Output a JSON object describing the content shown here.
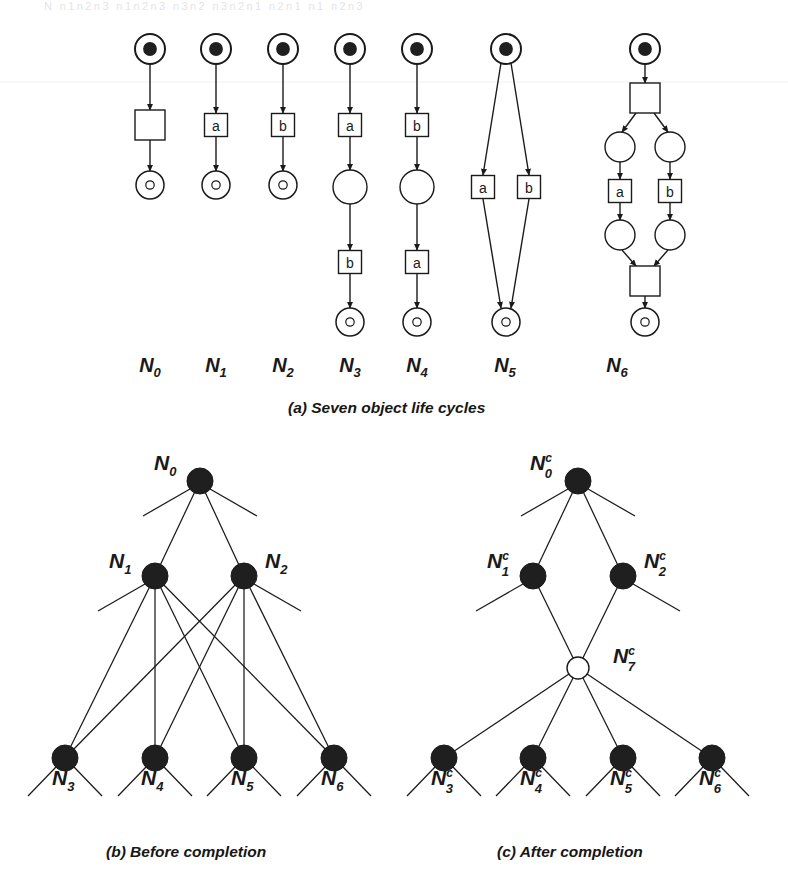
{
  "page": {
    "width": 788,
    "height": 892,
    "background": "#ffffff",
    "ink": "#1a1a1a",
    "node_fill_black": "#1f1f1f",
    "node_fill_white": "#ffffff",
    "header_faint_text": "N n1n2n3   n1n2n3 n3n2   n3n2n1   n2n1   n1   n2n3"
  },
  "figure": {
    "panels": [
      {
        "id": "a",
        "caption": "(a) Seven object life cycles",
        "caption_x": 288,
        "caption_y": 399
      },
      {
        "id": "b",
        "caption": "(b) Before completion",
        "caption_x": 106,
        "caption_y": 843
      },
      {
        "id": "c",
        "caption": "(c) After completion",
        "caption_x": 497,
        "caption_y": 843
      }
    ]
  },
  "panel_a": {
    "title": "Seven object life cycles",
    "net_labels": [
      {
        "text": "N",
        "sub": "0",
        "x": 150,
        "y": 372
      },
      {
        "text": "N",
        "sub": "1",
        "x": 216,
        "y": 372
      },
      {
        "text": "N",
        "sub": "2",
        "x": 283,
        "y": 372
      },
      {
        "text": "N",
        "sub": "3",
        "x": 350,
        "y": 372
      },
      {
        "text": "N",
        "sub": "4",
        "x": 417,
        "y": 372
      },
      {
        "text": "N",
        "sub": "5",
        "x": 505,
        "y": 372
      },
      {
        "text": "N",
        "sub": "6",
        "x": 617,
        "y": 372
      }
    ],
    "nets": [
      {
        "name": "N0",
        "places": [
          {
            "kind": "start",
            "cx": 150,
            "cy": 49,
            "r": 15
          },
          {
            "kind": "final",
            "cx": 150,
            "cy": 185,
            "r": 14
          }
        ],
        "transitions": [
          {
            "label": "",
            "cx": 150,
            "cy": 125,
            "w": 30,
            "h": 30
          }
        ],
        "arcs": [
          {
            "x1": 150,
            "y1": 64,
            "x2": 150,
            "y2": 110
          },
          {
            "x1": 150,
            "y1": 140,
            "x2": 150,
            "y2": 171
          }
        ]
      },
      {
        "name": "N1",
        "places": [
          {
            "kind": "start",
            "cx": 216,
            "cy": 49,
            "r": 15
          },
          {
            "kind": "final",
            "cx": 216,
            "cy": 185,
            "r": 14
          }
        ],
        "transitions": [
          {
            "label": "a",
            "cx": 216,
            "cy": 125,
            "w": 23,
            "h": 23
          }
        ],
        "arcs": [
          {
            "x1": 216,
            "y1": 64,
            "x2": 216,
            "y2": 113
          },
          {
            "x1": 216,
            "y1": 137,
            "x2": 216,
            "y2": 171
          }
        ]
      },
      {
        "name": "N2",
        "places": [
          {
            "kind": "start",
            "cx": 283,
            "cy": 49,
            "r": 15
          },
          {
            "kind": "final",
            "cx": 283,
            "cy": 185,
            "r": 14
          }
        ],
        "transitions": [
          {
            "label": "b",
            "cx": 283,
            "cy": 125,
            "w": 23,
            "h": 23
          }
        ],
        "arcs": [
          {
            "x1": 283,
            "y1": 64,
            "x2": 283,
            "y2": 113
          },
          {
            "x1": 283,
            "y1": 137,
            "x2": 283,
            "y2": 171
          }
        ]
      },
      {
        "name": "N3",
        "places": [
          {
            "kind": "start",
            "cx": 350,
            "cy": 49,
            "r": 15
          },
          {
            "kind": "plain",
            "cx": 350,
            "cy": 187,
            "r": 17
          },
          {
            "kind": "final",
            "cx": 350,
            "cy": 322,
            "r": 14
          }
        ],
        "transitions": [
          {
            "label": "a",
            "cx": 350,
            "cy": 125,
            "w": 23,
            "h": 23
          },
          {
            "label": "b",
            "cx": 350,
            "cy": 262,
            "w": 23,
            "h": 23
          }
        ],
        "arcs": [
          {
            "x1": 350,
            "y1": 64,
            "x2": 350,
            "y2": 113
          },
          {
            "x1": 350,
            "y1": 137,
            "x2": 350,
            "y2": 170
          },
          {
            "x1": 350,
            "y1": 204,
            "x2": 350,
            "y2": 250
          },
          {
            "x1": 350,
            "y1": 274,
            "x2": 350,
            "y2": 308
          }
        ]
      },
      {
        "name": "N4",
        "places": [
          {
            "kind": "start",
            "cx": 417,
            "cy": 49,
            "r": 15
          },
          {
            "kind": "plain",
            "cx": 417,
            "cy": 187,
            "r": 17
          },
          {
            "kind": "final",
            "cx": 417,
            "cy": 322,
            "r": 14
          }
        ],
        "transitions": [
          {
            "label": "b",
            "cx": 417,
            "cy": 125,
            "w": 23,
            "h": 23
          },
          {
            "label": "a",
            "cx": 417,
            "cy": 262,
            "w": 23,
            "h": 23
          }
        ],
        "arcs": [
          {
            "x1": 417,
            "y1": 64,
            "x2": 417,
            "y2": 113
          },
          {
            "x1": 417,
            "y1": 137,
            "x2": 417,
            "y2": 170
          },
          {
            "x1": 417,
            "y1": 204,
            "x2": 417,
            "y2": 250
          },
          {
            "x1": 417,
            "y1": 274,
            "x2": 417,
            "y2": 308
          }
        ]
      },
      {
        "name": "N5",
        "places": [
          {
            "kind": "start",
            "cx": 506,
            "cy": 49,
            "r": 15
          },
          {
            "kind": "final",
            "cx": 506,
            "cy": 322,
            "r": 14
          }
        ],
        "transitions": [
          {
            "label": "a",
            "cx": 483,
            "cy": 187,
            "w": 23,
            "h": 23
          },
          {
            "label": "b",
            "cx": 529,
            "cy": 187,
            "w": 23,
            "h": 23
          }
        ],
        "arcs": [
          {
            "x1": 501,
            "y1": 63,
            "x2": 483,
            "y2": 175
          },
          {
            "x1": 511,
            "y1": 63,
            "x2": 529,
            "y2": 175
          },
          {
            "x1": 483,
            "y1": 199,
            "x2": 501,
            "y2": 308
          },
          {
            "x1": 529,
            "y1": 199,
            "x2": 511,
            "y2": 308
          }
        ]
      },
      {
        "name": "N6",
        "places": [
          {
            "kind": "start",
            "cx": 645,
            "cy": 49,
            "r": 15
          },
          {
            "kind": "plain",
            "cx": 620,
            "cy": 147,
            "r": 15
          },
          {
            "kind": "plain",
            "cx": 670,
            "cy": 147,
            "r": 15
          },
          {
            "kind": "plain",
            "cx": 620,
            "cy": 235,
            "r": 15
          },
          {
            "kind": "plain",
            "cx": 670,
            "cy": 235,
            "r": 15
          },
          {
            "kind": "final",
            "cx": 645,
            "cy": 322,
            "r": 14
          }
        ],
        "transitions": [
          {
            "label": "",
            "cx": 645,
            "cy": 98,
            "w": 30,
            "h": 30
          },
          {
            "label": "a",
            "cx": 620,
            "cy": 191,
            "w": 23,
            "h": 23
          },
          {
            "label": "b",
            "cx": 670,
            "cy": 191,
            "w": 23,
            "h": 23
          },
          {
            "label": "",
            "cx": 645,
            "cy": 281,
            "w": 30,
            "h": 30
          }
        ],
        "arcs": [
          {
            "x1": 645,
            "y1": 64,
            "x2": 645,
            "y2": 83
          },
          {
            "x1": 636,
            "y1": 113,
            "x2": 622,
            "y2": 132
          },
          {
            "x1": 654,
            "y1": 113,
            "x2": 668,
            "y2": 132
          },
          {
            "x1": 620,
            "y1": 162,
            "x2": 620,
            "y2": 179
          },
          {
            "x1": 670,
            "y1": 162,
            "x2": 670,
            "y2": 179
          },
          {
            "x1": 620,
            "y1": 203,
            "x2": 620,
            "y2": 220
          },
          {
            "x1": 670,
            "y1": 203,
            "x2": 670,
            "y2": 220
          },
          {
            "x1": 622,
            "y1": 250,
            "x2": 636,
            "y2": 266
          },
          {
            "x1": 668,
            "y1": 250,
            "x2": 654,
            "y2": 266
          },
          {
            "x1": 645,
            "y1": 296,
            "x2": 645,
            "y2": 308
          }
        ]
      }
    ]
  },
  "panel_b": {
    "title": "Before completion",
    "nodes": [
      {
        "id": "N0",
        "label": "N",
        "sub": "0",
        "sup": "",
        "cx": 200,
        "cy": 481,
        "r": 13,
        "fill": "black",
        "label_x": 154,
        "label_y": 470
      },
      {
        "id": "N1",
        "label": "N",
        "sub": "1",
        "sup": "",
        "cx": 155,
        "cy": 576,
        "r": 13,
        "fill": "black",
        "label_x": 109,
        "label_y": 568
      },
      {
        "id": "N2",
        "label": "N",
        "sub": "2",
        "sup": "",
        "cx": 244,
        "cy": 576,
        "r": 13,
        "fill": "black",
        "label_x": 265,
        "label_y": 568
      },
      {
        "id": "N3",
        "label": "N",
        "sub": "3",
        "sup": "",
        "cx": 65,
        "cy": 758,
        "r": 13,
        "fill": "black",
        "label_x": 52,
        "label_y": 785
      },
      {
        "id": "N4",
        "label": "N",
        "sub": "4",
        "sup": "",
        "cx": 155,
        "cy": 758,
        "r": 13,
        "fill": "black",
        "label_x": 141,
        "label_y": 785
      },
      {
        "id": "N5",
        "label": "N",
        "sub": "5",
        "sup": "",
        "cx": 244,
        "cy": 758,
        "r": 13,
        "fill": "black",
        "label_x": 231,
        "label_y": 785
      },
      {
        "id": "N6",
        "label": "N",
        "sub": "6",
        "sup": "",
        "cx": 334,
        "cy": 758,
        "r": 13,
        "fill": "black",
        "label_x": 321,
        "label_y": 785
      }
    ],
    "edges": [
      {
        "from": "N0",
        "to": "N1"
      },
      {
        "from": "N0",
        "to": "N2"
      },
      {
        "from": "N1",
        "to": "N3"
      },
      {
        "from": "N1",
        "to": "N4"
      },
      {
        "from": "N1",
        "to": "N5"
      },
      {
        "from": "N1",
        "to": "N6"
      },
      {
        "from": "N2",
        "to": "N3"
      },
      {
        "from": "N2",
        "to": "N4"
      },
      {
        "from": "N2",
        "to": "N5"
      },
      {
        "from": "N2",
        "to": "N6"
      }
    ],
    "stubs": [
      {
        "x1": 190,
        "y1": 489,
        "x2": 143,
        "y2": 516
      },
      {
        "x1": 210,
        "y1": 489,
        "x2": 257,
        "y2": 516
      },
      {
        "x1": 145,
        "y1": 584,
        "x2": 98,
        "y2": 611
      },
      {
        "x1": 254,
        "y1": 584,
        "x2": 301,
        "y2": 611
      },
      {
        "x1": 56,
        "y1": 767,
        "x2": 28,
        "y2": 796
      },
      {
        "x1": 74,
        "y1": 767,
        "x2": 102,
        "y2": 796
      },
      {
        "x1": 146,
        "y1": 767,
        "x2": 118,
        "y2": 796
      },
      {
        "x1": 164,
        "y1": 767,
        "x2": 192,
        "y2": 796
      },
      {
        "x1": 235,
        "y1": 767,
        "x2": 207,
        "y2": 796
      },
      {
        "x1": 253,
        "y1": 767,
        "x2": 281,
        "y2": 796
      },
      {
        "x1": 325,
        "y1": 767,
        "x2": 297,
        "y2": 796
      },
      {
        "x1": 343,
        "y1": 767,
        "x2": 371,
        "y2": 796
      }
    ]
  },
  "panel_c": {
    "title": "After completion",
    "nodes": [
      {
        "id": "N0c",
        "label": "N",
        "sub": "0",
        "sup": "c",
        "cx": 578,
        "cy": 481,
        "r": 13,
        "fill": "black",
        "label_x": 530,
        "label_y": 470
      },
      {
        "id": "N1c",
        "label": "N",
        "sub": "1",
        "sup": "c",
        "cx": 533,
        "cy": 576,
        "r": 13,
        "fill": "black",
        "label_x": 487,
        "label_y": 568
      },
      {
        "id": "N2c",
        "label": "N",
        "sub": "2",
        "sup": "c",
        "cx": 623,
        "cy": 576,
        "r": 13,
        "fill": "black",
        "label_x": 644,
        "label_y": 568
      },
      {
        "id": "N7c",
        "label": "N",
        "sub": "7",
        "sup": "c",
        "cx": 578,
        "cy": 668,
        "r": 11,
        "fill": "white",
        "label_x": 613,
        "label_y": 663
      },
      {
        "id": "N3c",
        "label": "N",
        "sub": "3",
        "sup": "c",
        "cx": 444,
        "cy": 758,
        "r": 13,
        "fill": "black",
        "label_x": 431,
        "label_y": 785
      },
      {
        "id": "N4c",
        "label": "N",
        "sub": "4",
        "sup": "c",
        "cx": 533,
        "cy": 758,
        "r": 13,
        "fill": "black",
        "label_x": 520,
        "label_y": 785
      },
      {
        "id": "N5c",
        "label": "N",
        "sub": "5",
        "sup": "c",
        "cx": 623,
        "cy": 758,
        "r": 13,
        "fill": "black",
        "label_x": 610,
        "label_y": 785
      },
      {
        "id": "N6c",
        "label": "N",
        "sub": "6",
        "sup": "c",
        "cx": 712,
        "cy": 758,
        "r": 13,
        "fill": "black",
        "label_x": 699,
        "label_y": 785
      }
    ],
    "edges": [
      {
        "from": "N0c",
        "to": "N1c"
      },
      {
        "from": "N0c",
        "to": "N2c"
      },
      {
        "from": "N1c",
        "to": "N7c"
      },
      {
        "from": "N2c",
        "to": "N7c"
      },
      {
        "from": "N7c",
        "to": "N3c"
      },
      {
        "from": "N7c",
        "to": "N4c"
      },
      {
        "from": "N7c",
        "to": "N5c"
      },
      {
        "from": "N7c",
        "to": "N6c"
      }
    ],
    "stubs": [
      {
        "x1": 568,
        "y1": 489,
        "x2": 521,
        "y2": 516
      },
      {
        "x1": 588,
        "y1": 489,
        "x2": 635,
        "y2": 516
      },
      {
        "x1": 523,
        "y1": 584,
        "x2": 476,
        "y2": 611
      },
      {
        "x1": 633,
        "y1": 584,
        "x2": 680,
        "y2": 611
      },
      {
        "x1": 435,
        "y1": 767,
        "x2": 407,
        "y2": 796
      },
      {
        "x1": 453,
        "y1": 767,
        "x2": 481,
        "y2": 796
      },
      {
        "x1": 524,
        "y1": 767,
        "x2": 496,
        "y2": 796
      },
      {
        "x1": 542,
        "y1": 767,
        "x2": 570,
        "y2": 796
      },
      {
        "x1": 614,
        "y1": 767,
        "x2": 586,
        "y2": 796
      },
      {
        "x1": 632,
        "y1": 767,
        "x2": 660,
        "y2": 796
      },
      {
        "x1": 703,
        "y1": 767,
        "x2": 675,
        "y2": 796
      },
      {
        "x1": 721,
        "y1": 767,
        "x2": 749,
        "y2": 796
      }
    ]
  }
}
